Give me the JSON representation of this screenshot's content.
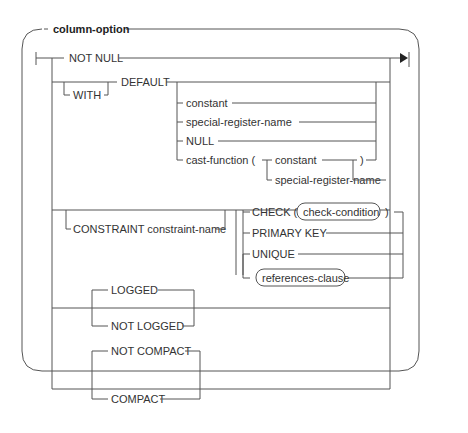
{
  "diagram": {
    "title": "column-option",
    "type": "syntax-railroad-diagram",
    "line_color": "#555555",
    "text_color": "#333333",
    "items": {
      "not_null": "NOT NULL",
      "with": "WITH",
      "default": "DEFAULT",
      "constant": "constant",
      "special_register_name": "special-register-name",
      "null": "NULL",
      "cast_function": "cast-function (",
      "cast_constant": "constant",
      "cast_special_register_name": "special-register-name",
      "close_paren": ")",
      "constraint": "CONSTRAINT constraint-name",
      "check_open": "CHECK (",
      "check_condition": "check-condition",
      "check_close": ")",
      "primary_key": "PRIMARY KEY",
      "unique": "UNIQUE",
      "references_clause": "references-clause",
      "logged": "LOGGED",
      "not_logged": "NOT LOGGED",
      "not_compact": "NOT COMPACT",
      "compact": "COMPACT"
    }
  }
}
